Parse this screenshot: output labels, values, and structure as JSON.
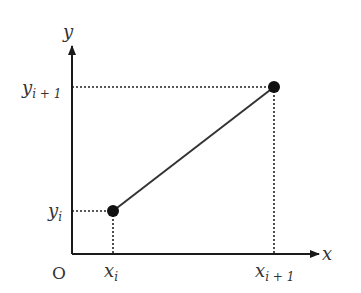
{
  "diagram": {
    "type": "linear-interpolation-segment",
    "colors": {
      "axis": "#1a1a1a",
      "segment": "#333333",
      "guide": "#222222",
      "point": "#111111",
      "text": "#333333"
    },
    "axes": {
      "x_label": "x",
      "y_label": "y",
      "origin_label": "O"
    },
    "points": [
      {
        "id": "p_i",
        "x_label_base": "x",
        "x_label_sub": "i",
        "y_label_base": "y",
        "y_label_sub": "i"
      },
      {
        "id": "p_i_plus_1",
        "x_label_base": "x",
        "x_label_sub": "i + 1",
        "y_label_base": "y",
        "y_label_sub": "i + 1"
      }
    ]
  }
}
